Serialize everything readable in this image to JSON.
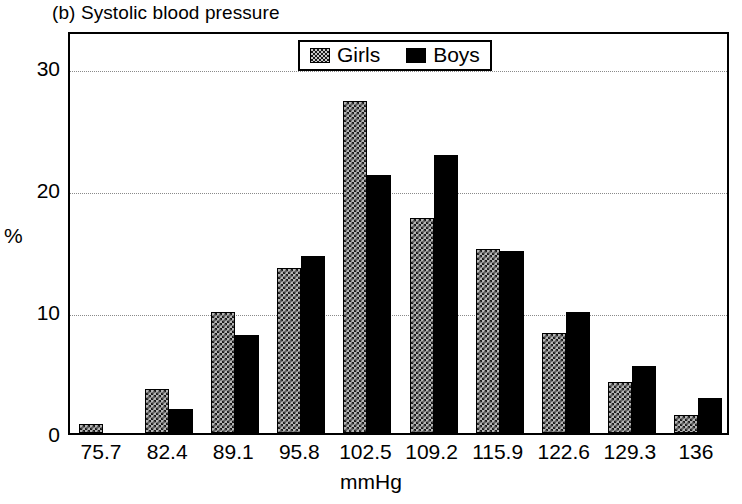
{
  "chart_data": {
    "type": "bar",
    "title": "(b) Systolic blood pressure",
    "xlabel": "mmHg",
    "ylabel": "%",
    "categories": [
      "75.7",
      "82.4",
      "89.1",
      "95.8",
      "102.5",
      "109.2",
      "115.9",
      "122.6",
      "129.3",
      "136"
    ],
    "series": [
      {
        "name": "Girls",
        "values": [
          0.7,
          3.6,
          9.9,
          13.5,
          27.2,
          17.6,
          15.1,
          8.2,
          4.2,
          1.5
        ]
      },
      {
        "name": "Boys",
        "values": [
          0.0,
          2.0,
          8.0,
          14.5,
          21.1,
          22.8,
          14.9,
          9.9,
          5.5,
          2.9
        ]
      }
    ],
    "ylim": [
      0,
      33
    ],
    "yticks": [
      0,
      10,
      20,
      30
    ],
    "ytick_labels": [
      "0",
      "10",
      "20",
      "30"
    ],
    "grid": true,
    "gridlines_at": [
      10,
      20,
      30
    ],
    "legend_position": "top-center",
    "colors": {
      "girls": "#b4b4b4",
      "boys": "#000000",
      "axis": "#000000",
      "grid": "#8a8a8a",
      "background": "#ffffff"
    }
  }
}
